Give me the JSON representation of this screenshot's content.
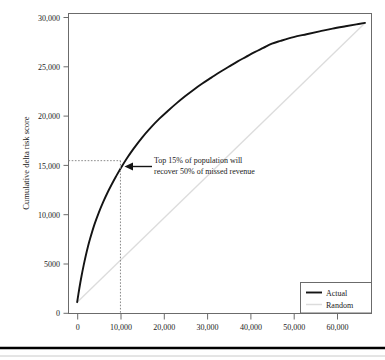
{
  "figure": {
    "background_color": "#ffffff",
    "footer_rule": true
  },
  "chart_data": {
    "type": "line",
    "title": "",
    "subtitle": "",
    "xlabel": "",
    "ylabel": "Cumulative delta risk score",
    "xlim": [
      -2000,
      68000
    ],
    "ylim": [
      -1200,
      30600
    ],
    "xticks": [
      0,
      10000,
      20000,
      30000,
      40000,
      50000,
      60000
    ],
    "xtick_labels": [
      "0",
      "10,000",
      "20,000",
      "30,000",
      "40,000",
      "50,000",
      "60,000"
    ],
    "yticks": [
      0,
      5000,
      10000,
      15000,
      20000,
      25000,
      30000
    ],
    "ytick_labels": [
      "0",
      "5000",
      "10,000",
      "15,000",
      "20,000",
      "25,000",
      "30,000"
    ],
    "grid": false,
    "legend_position": "bottom-right",
    "series": [
      {
        "name": "Actual",
        "color": "#141414",
        "width": 1.9,
        "x": [
          0,
          500,
          1000,
          1500,
          2000,
          2500,
          3000,
          4000,
          5000,
          6000,
          7000,
          8000,
          9000,
          10000,
          11500,
          13000,
          15000,
          17000,
          19000,
          21000,
          23000,
          25000,
          27000,
          29000,
          31000,
          33000,
          35000,
          37000,
          39000,
          41000,
          43000,
          45000,
          47000,
          50000,
          53000,
          56000,
          59000,
          62000,
          64500,
          66500
        ],
        "y": [
          0,
          1450,
          2750,
          3900,
          4950,
          5900,
          6750,
          8250,
          9500,
          10600,
          11600,
          12500,
          13350,
          14150,
          15250,
          16250,
          17450,
          18500,
          19450,
          20300,
          21100,
          21850,
          22550,
          23200,
          23800,
          24400,
          24950,
          25500,
          26000,
          26500,
          26950,
          27400,
          27700,
          28100,
          28400,
          28700,
          29000,
          29250,
          29450,
          29600
        ]
      },
      {
        "name": "Random",
        "color": "#dcdcdc",
        "width": 1.3,
        "x": [
          0,
          66500
        ],
        "y": [
          0,
          29600
        ]
      }
    ],
    "annotations": [
      {
        "name": "callout",
        "lines": [
          "Top 15% of population will",
          "recover 50% of missed revenue"
        ],
        "arrow_target_x": 10000,
        "arrow_target_y": 15000
      }
    ],
    "guides": [
      {
        "name": "horizontal-15000",
        "type": "horizontal",
        "value": 15000,
        "from": 0,
        "to": 10000
      },
      {
        "name": "vertical-10000",
        "type": "vertical",
        "value": 10000,
        "from": 0,
        "to": 15000
      }
    ]
  },
  "legend": {
    "items": [
      {
        "label": "Actual",
        "color": "#141414"
      },
      {
        "label": "Random",
        "color": "#dcdcdc"
      }
    ]
  }
}
